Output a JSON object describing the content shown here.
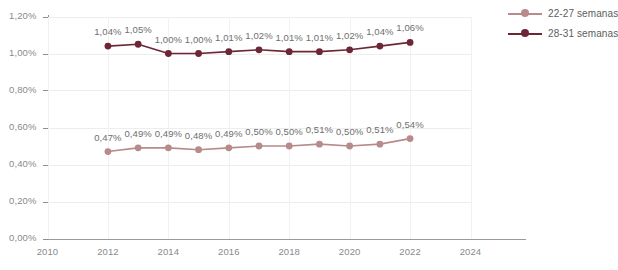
{
  "chart_data": {
    "type": "line",
    "title": "",
    "subtitle": "",
    "xlabel": "",
    "ylabel": "",
    "x": [
      2012,
      2013,
      2014,
      2015,
      2016,
      2017,
      2018,
      2019,
      2020,
      2021,
      2022
    ],
    "xlim": [
      2010,
      2024
    ],
    "ylim": [
      0,
      1.2
    ],
    "grid": true,
    "legend_position": "right",
    "x_tick_labels": [
      "2010",
      "2012",
      "2014",
      "2016",
      "2018",
      "2020",
      "2022",
      "2024"
    ],
    "x_tick_values": [
      2010,
      2012,
      2014,
      2016,
      2018,
      2020,
      2022,
      2024
    ],
    "y_tick_labels": [
      "0,00%",
      "0,20%",
      "0,40%",
      "0,60%",
      "0,80%",
      "1,00%",
      "1,20%"
    ],
    "y_tick_values": [
      0,
      0.2,
      0.4,
      0.6,
      0.8,
      1.0,
      1.2
    ],
    "series": [
      {
        "name": "22-27 semanas",
        "color": "#b78b8b",
        "values": [
          0.47,
          0.49,
          0.49,
          0.48,
          0.49,
          0.5,
          0.5,
          0.51,
          0.5,
          0.51,
          0.54
        ],
        "labels": [
          "0,47%",
          "0,49%",
          "0,49%",
          "0,48%",
          "0,49%",
          "0,50%",
          "0,50%",
          "0,51%",
          "0,50%",
          "0,51%",
          "0,54%"
        ]
      },
      {
        "name": "28-31 semanas",
        "color": "#6d2636",
        "values": [
          1.04,
          1.05,
          1.0,
          1.0,
          1.01,
          1.02,
          1.01,
          1.01,
          1.02,
          1.04,
          1.06
        ],
        "labels": [
          "1,04%",
          "1,05%",
          "1,00%",
          "1,00%",
          "1,01%",
          "1,02%",
          "1,01%",
          "1,01%",
          "1,02%",
          "1,04%",
          "1,06%"
        ]
      }
    ]
  },
  "legend": {
    "items": [
      {
        "label": "22-27 semanas",
        "color": "#b78b8b"
      },
      {
        "label": "28-31 semanas",
        "color": "#6d2636"
      }
    ]
  }
}
